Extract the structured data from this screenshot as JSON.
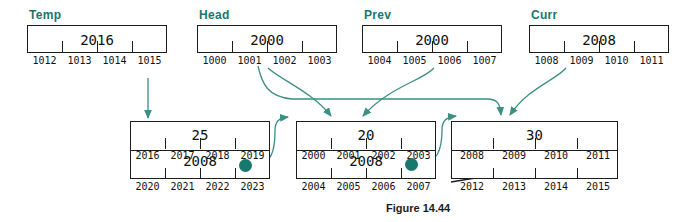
{
  "figure": {
    "caption": "Figure 14.44",
    "accent_color": "#17786c",
    "ink_color": "#1c1c1c"
  },
  "pointer_variables": [
    {
      "name": "Temp",
      "label": "Temp",
      "value": "2016",
      "addresses": [
        "1012",
        "1013",
        "1014",
        "1015"
      ]
    },
    {
      "name": "Head",
      "label": "Head",
      "value": "2000",
      "addresses": [
        "1000",
        "1001",
        "1002",
        "1003"
      ]
    },
    {
      "name": "Prev",
      "label": "Prev",
      "value": "2000",
      "addresses": [
        "1004",
        "1005",
        "1006",
        "1007"
      ]
    },
    {
      "name": "Curr",
      "label": "Curr",
      "value": "2008",
      "addresses": [
        "1008",
        "1009",
        "1010",
        "1011"
      ]
    }
  ],
  "nodes": [
    {
      "name": "node-temp",
      "data_value": "25",
      "next_value": "2008",
      "data_addresses": [
        "2016",
        "2017",
        "2018",
        "2019"
      ],
      "next_addresses": [
        "2020",
        "2021",
        "2022",
        "2023"
      ],
      "next_is_null": false,
      "has_pointer_dot": true
    },
    {
      "name": "node-head",
      "data_value": "20",
      "next_value": "2008",
      "data_addresses": [
        "2000",
        "2001",
        "2002",
        "2003"
      ],
      "next_addresses": [
        "2004",
        "2005",
        "2006",
        "2007"
      ],
      "next_is_null": false,
      "has_pointer_dot": true
    },
    {
      "name": "node-curr",
      "data_value": "30",
      "next_value": "",
      "data_addresses": [
        "2008",
        "2009",
        "2010",
        "2011"
      ],
      "next_addresses": [
        "2012",
        "2013",
        "2014",
        "2015"
      ],
      "next_is_null": true,
      "has_pointer_dot": false
    }
  ],
  "arrows": [
    {
      "name": "arrow-temp-to-node-temp",
      "from": "Temp",
      "to": "node-temp"
    },
    {
      "name": "arrow-head-to-node-head",
      "from": "Head",
      "to": "node-head"
    },
    {
      "name": "arrow-head-to-node-curr",
      "from": "Head",
      "to": "node-curr"
    },
    {
      "name": "arrow-prev-to-node-head",
      "from": "Prev",
      "to": "node-head"
    },
    {
      "name": "arrow-curr-to-node-curr",
      "from": "Curr",
      "to": "node-curr"
    },
    {
      "name": "arrow-node-temp-next-to-node-head",
      "from": "node-temp.next",
      "to": "node-head"
    },
    {
      "name": "arrow-node-head-next-to-node-curr",
      "from": "node-head.next",
      "to": "node-curr"
    }
  ]
}
